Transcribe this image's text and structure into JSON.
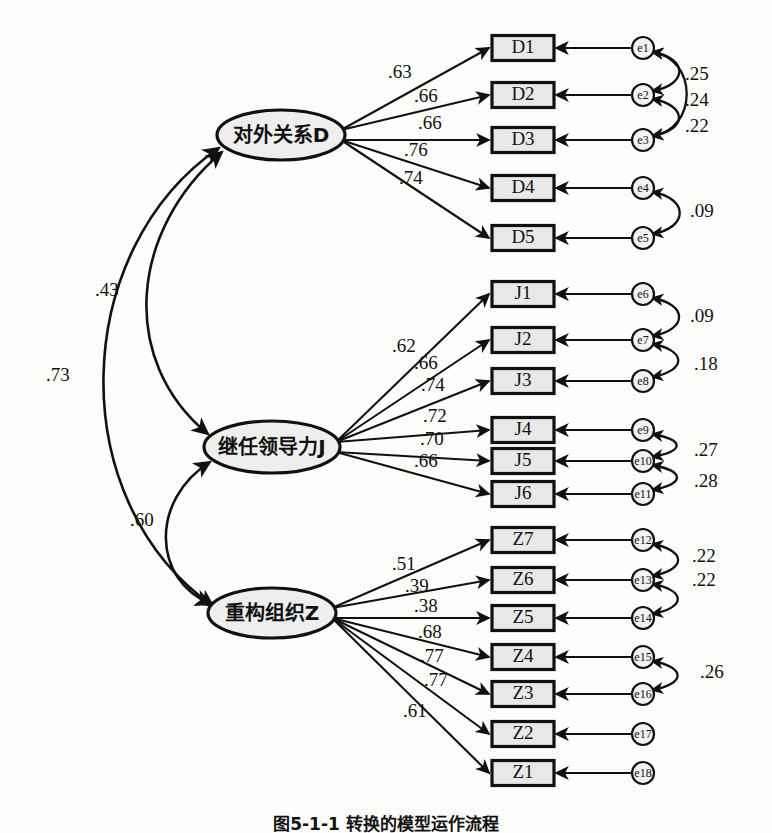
{
  "figure": {
    "caption": "图5-1-1  转换的模型运作流程",
    "type": "structural-equation-model-path-diagram"
  },
  "chart_data": {
    "type": "diagram",
    "title": "图5-1-1  转换的模型运作流程",
    "notation": "CFA path diagram: ellipses = latent factors, rectangles = observed indicators, small circles = measurement error terms, straight single-headed arrows = standardized factor loadings, curved double-headed arrows = correlations",
    "factors": [
      {
        "id": "D",
        "label": "对外关系D",
        "cx": 281,
        "cy": 135,
        "rx": 64,
        "ry": 25,
        "indicators": [
          "D1",
          "D2",
          "D3",
          "D4",
          "D5"
        ],
        "loadings": [
          ".63",
          ".66",
          ".66",
          ".76",
          ".74"
        ]
      },
      {
        "id": "J",
        "label": "继任领导力J",
        "cx": 272,
        "cy": 447,
        "rx": 68,
        "ry": 26,
        "indicators": [
          "J1",
          "J2",
          "J3",
          "J4",
          "J5",
          "J6"
        ],
        "loadings": [
          ".62",
          ".66",
          ".74",
          ".72",
          ".70",
          ".66"
        ]
      },
      {
        "id": "Z",
        "label": "重构组织Z",
        "cx": 272,
        "cy": 613,
        "rx": 64,
        "ry": 25,
        "indicators": [
          "Z7",
          "Z6",
          "Z5",
          "Z4",
          "Z3",
          "Z2",
          "Z1"
        ],
        "loadings": [
          ".51",
          ".39",
          ".38",
          ".68",
          ".77",
          ".77",
          ".61"
        ]
      }
    ],
    "indicators": [
      {
        "id": "D1",
        "label": "D1",
        "y": 48,
        "error": "e1",
        "factor": "D",
        "loading": ".63"
      },
      {
        "id": "D2",
        "label": "D2",
        "y": 95,
        "error": "e2",
        "factor": "D",
        "loading": ".66"
      },
      {
        "id": "D3",
        "label": "D3",
        "y": 140,
        "error": "e3",
        "factor": "D",
        "loading": ".66"
      },
      {
        "id": "D4",
        "label": "D4",
        "y": 188,
        "error": "e4",
        "factor": "D",
        "loading": ".76"
      },
      {
        "id": "D5",
        "label": "D5",
        "y": 238,
        "error": "e5",
        "factor": "D",
        "loading": ".74"
      },
      {
        "id": "J1",
        "label": "J1",
        "y": 294,
        "error": "e6",
        "factor": "J",
        "loading": ".62"
      },
      {
        "id": "J2",
        "label": "J2",
        "y": 340,
        "error": "e7",
        "factor": "J",
        "loading": ".66"
      },
      {
        "id": "J3",
        "label": "J3",
        "y": 381,
        "error": "e8",
        "factor": "J",
        "loading": ".74"
      },
      {
        "id": "J4",
        "label": "J4",
        "y": 430,
        "error": "e9",
        "factor": "J",
        "loading": ".72"
      },
      {
        "id": "J5",
        "label": "J5",
        "y": 461,
        "error": "e10",
        "factor": "J",
        "loading": ".70"
      },
      {
        "id": "J6",
        "label": "J6",
        "y": 494,
        "error": "e11",
        "factor": "J",
        "loading": ".66"
      },
      {
        "id": "Z7",
        "label": "Z7",
        "y": 540,
        "error": "e12",
        "factor": "Z",
        "loading": ".51"
      },
      {
        "id": "Z6",
        "label": "Z6",
        "y": 580,
        "error": "e13",
        "factor": "Z",
        "loading": ".39"
      },
      {
        "id": "Z5",
        "label": "Z5",
        "y": 618,
        "error": "e14",
        "factor": "Z",
        "loading": ".38"
      },
      {
        "id": "Z4",
        "label": "Z4",
        "y": 657,
        "error": "e15",
        "factor": "Z",
        "loading": ".68"
      },
      {
        "id": "Z3",
        "label": "Z3",
        "y": 694,
        "error": "e16",
        "factor": "Z",
        "loading": ".77"
      },
      {
        "id": "Z2",
        "label": "Z2",
        "y": 734,
        "error": "e17",
        "factor": "Z",
        "loading": ".77"
      },
      {
        "id": "Z1",
        "label": "Z1",
        "y": 773,
        "error": "e18",
        "factor": "Z",
        "loading": ".61"
      }
    ],
    "loading_labels": [
      {
        "text": ".63",
        "x": 388,
        "y": 74
      },
      {
        "text": ".66",
        "x": 414,
        "y": 98
      },
      {
        "text": ".66",
        "x": 418,
        "y": 125
      },
      {
        "text": ".76",
        "x": 404,
        "y": 152
      },
      {
        "text": ".74",
        "x": 399,
        "y": 180
      },
      {
        "text": ".62",
        "x": 392,
        "y": 348
      },
      {
        "text": ".66",
        "x": 414,
        "y": 365
      },
      {
        "text": ".74",
        "x": 421,
        "y": 387
      },
      {
        "text": ".72",
        "x": 423,
        "y": 418
      },
      {
        "text": ".70",
        "x": 420,
        "y": 441
      },
      {
        "text": ".66",
        "x": 414,
        "y": 463
      },
      {
        "text": ".51",
        "x": 392,
        "y": 566
      },
      {
        "text": ".39",
        "x": 405,
        "y": 588
      },
      {
        "text": ".38",
        "x": 414,
        "y": 608
      },
      {
        "text": ".68",
        "x": 418,
        "y": 634
      },
      {
        "text": ".77",
        "x": 420,
        "y": 658
      },
      {
        "text": ".77",
        "x": 424,
        "y": 682
      },
      {
        "text": ".61",
        "x": 403,
        "y": 713
      }
    ],
    "error_correlations": [
      {
        "between": [
          "e1",
          "e2"
        ],
        "value": ".25",
        "label_x": 685,
        "label_y": 76
      },
      {
        "between": [
          "e2",
          "e3"
        ],
        "value": ".24",
        "label_x": 685,
        "label_y": 102
      },
      {
        "between": [
          "e1",
          "e3"
        ],
        "value": ".22",
        "label_x": 685,
        "label_y": 128
      },
      {
        "between": [
          "e4",
          "e5"
        ],
        "value": ".09",
        "label_x": 690,
        "label_y": 213
      },
      {
        "between": [
          "e6",
          "e7"
        ],
        "value": ".09",
        "label_x": 690,
        "label_y": 318
      },
      {
        "between": [
          "e7",
          "e8"
        ],
        "value": ".18",
        "label_x": 694,
        "label_y": 366
      },
      {
        "between": [
          "e9",
          "e10"
        ],
        "value": ".27",
        "label_x": 694,
        "label_y": 452
      },
      {
        "between": [
          "e10",
          "e11"
        ],
        "value": ".28",
        "label_x": 694,
        "label_y": 483
      },
      {
        "between": [
          "e12",
          "e13"
        ],
        "value": ".22",
        "label_x": 692,
        "label_y": 558
      },
      {
        "between": [
          "e13",
          "e14"
        ],
        "value": ".22",
        "label_x": 692,
        "label_y": 582
      },
      {
        "between": [
          "e15",
          "e16"
        ],
        "value": ".26",
        "label_x": 700,
        "label_y": 674
      }
    ],
    "factor_correlations": [
      {
        "between": [
          "D",
          "J"
        ],
        "value": ".43",
        "label_x": 95,
        "label_y": 292
      },
      {
        "between": [
          "D",
          "Z"
        ],
        "value": ".73",
        "label_x": 46,
        "label_y": 377
      },
      {
        "between": [
          "J",
          "Z"
        ],
        "value": ".60",
        "label_x": 130,
        "label_y": 522
      }
    ]
  }
}
